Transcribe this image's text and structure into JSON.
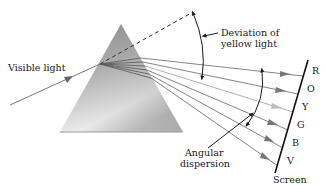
{
  "diagram": {
    "labels": {
      "incident": "Visible light",
      "deviation_line1": "Deviation of",
      "deviation_line2": "yellow light",
      "dispersion_line1": "Angular",
      "dispersion_line2": "dispersion",
      "screen": "Screen"
    },
    "spectrum": [
      {
        "letter": "R",
        "name": "red"
      },
      {
        "letter": "O",
        "name": "orange"
      },
      {
        "letter": "Y",
        "name": "yellow"
      },
      {
        "letter": "G",
        "name": "green"
      },
      {
        "letter": "B",
        "name": "blue"
      },
      {
        "letter": "V",
        "name": "violet"
      }
    ],
    "colors": {
      "prism_dark": "#8a8a8a",
      "prism_light": "#f2f2f2",
      "rays": "#6e6e6e",
      "ink": "#1a1a1a"
    }
  }
}
